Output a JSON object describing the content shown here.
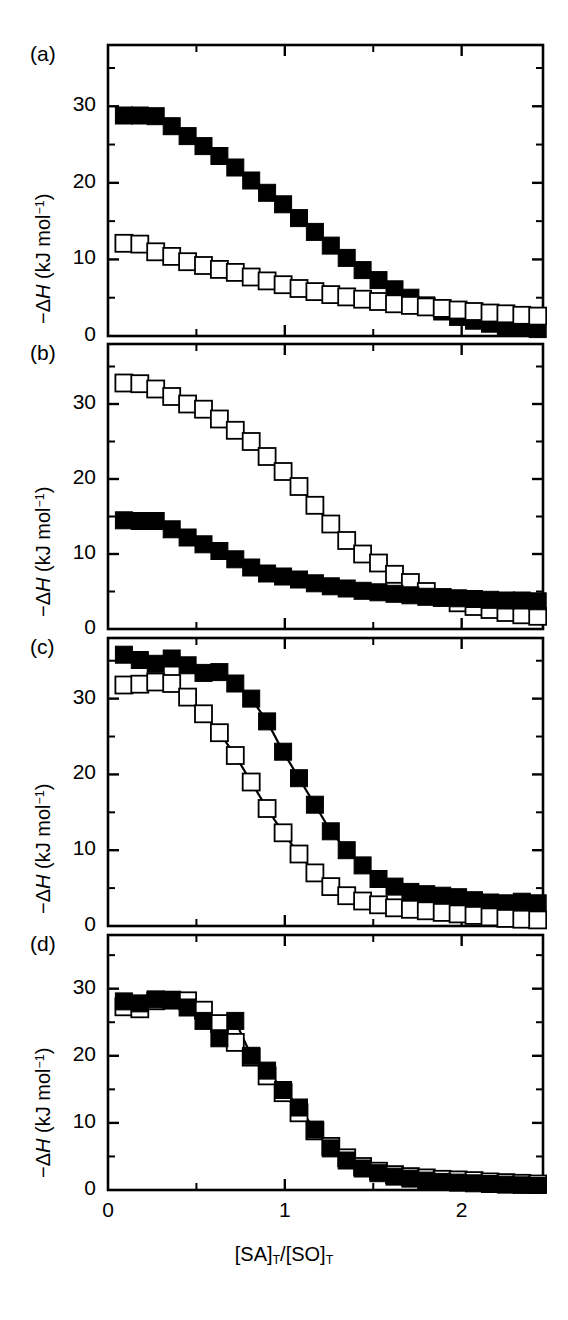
{
  "figure": {
    "width": 568,
    "height": 1320,
    "background": "#ffffff",
    "ink": "#000000",
    "xaxis_title_parts": {
      "lead": "[SA]",
      "sub1": "T",
      "slash": "/[SO]",
      "sub2": "T"
    },
    "yaxis_title_parts": {
      "minus": "−Δ",
      "italic": "H",
      "rest": " (kJ mol",
      "sup": "−1",
      "close": ")"
    },
    "panel_labels": [
      "(a)",
      "(b)",
      "(c)",
      "(d)"
    ]
  },
  "chart_data": [
    {
      "type": "scatter",
      "panel": "(a)",
      "title": "",
      "xlabel": "[SA]T/[SO]T",
      "ylabel": "−ΔH (kJ mol−1)",
      "xlim": [
        0,
        2.46
      ],
      "ylim": [
        0,
        38
      ],
      "xticks": [
        0,
        1,
        2
      ],
      "xticklabels": [
        "0",
        "1",
        "2"
      ],
      "xminorticks": [
        0.5,
        1.5
      ],
      "yticks": [
        0,
        10,
        20,
        30
      ],
      "yticklabels": [
        "0",
        "10",
        "20",
        "30"
      ],
      "yminorticks": [
        5,
        15,
        25,
        35
      ],
      "grid": false,
      "legend": "none",
      "series": [
        {
          "name": "filled-squares",
          "marker": "filled-square",
          "color": "#000000",
          "x": [
            0.09,
            0.18,
            0.27,
            0.36,
            0.45,
            0.54,
            0.63,
            0.72,
            0.81,
            0.9,
            0.99,
            1.08,
            1.17,
            1.26,
            1.35,
            1.44,
            1.53,
            1.62,
            1.71,
            1.8,
            1.89,
            1.98,
            2.07,
            2.16,
            2.25,
            2.34,
            2.43
          ],
          "values": [
            28.8,
            28.8,
            28.7,
            27.4,
            26.1,
            24.8,
            23.5,
            22.0,
            20.3,
            18.7,
            17.2,
            15.4,
            13.6,
            11.8,
            10.2,
            8.6,
            7.3,
            6.1,
            5.0,
            4.0,
            3.2,
            2.5,
            2.0,
            1.6,
            1.3,
            1.1,
            0.9
          ]
        },
        {
          "name": "open-squares",
          "marker": "open-square",
          "color": "#000000",
          "x": [
            0.09,
            0.18,
            0.27,
            0.36,
            0.45,
            0.54,
            0.63,
            0.72,
            0.81,
            0.9,
            0.99,
            1.08,
            1.17,
            1.26,
            1.35,
            1.44,
            1.53,
            1.62,
            1.71,
            1.8,
            1.89,
            1.98,
            2.07,
            2.16,
            2.25,
            2.34,
            2.43
          ],
          "values": [
            12.1,
            12.0,
            11.0,
            10.4,
            9.7,
            9.2,
            8.7,
            8.3,
            7.7,
            7.2,
            6.7,
            6.2,
            5.8,
            5.4,
            5.1,
            4.8,
            4.5,
            4.2,
            4.0,
            3.8,
            3.6,
            3.4,
            3.2,
            3.0,
            2.9,
            2.7,
            2.6
          ]
        }
      ]
    },
    {
      "type": "scatter",
      "panel": "(b)",
      "title": "",
      "xlabel": "[SA]T/[SO]T",
      "ylabel": "−ΔH (kJ mol−1)",
      "xlim": [
        0,
        2.46
      ],
      "ylim": [
        0,
        38
      ],
      "xticks": [
        0,
        1,
        2
      ],
      "xticklabels": [
        "0",
        "1",
        "2"
      ],
      "xminorticks": [
        0.5,
        1.5
      ],
      "yticks": [
        0,
        10,
        20,
        30
      ],
      "yticklabels": [
        "0",
        "10",
        "20",
        "30"
      ],
      "yminorticks": [
        5,
        15,
        25,
        35
      ],
      "grid": false,
      "legend": "none",
      "series": [
        {
          "name": "open-squares",
          "marker": "open-square",
          "color": "#000000",
          "x": [
            0.09,
            0.18,
            0.27,
            0.36,
            0.45,
            0.54,
            0.63,
            0.72,
            0.81,
            0.9,
            0.99,
            1.08,
            1.17,
            1.26,
            1.35,
            1.44,
            1.53,
            1.62,
            1.71,
            1.8,
            1.89,
            1.98,
            2.07,
            2.16,
            2.25,
            2.34,
            2.43
          ],
          "values": [
            32.8,
            32.7,
            32.0,
            31.0,
            30.0,
            29.3,
            28.0,
            26.5,
            25.0,
            23.0,
            21.0,
            19.0,
            16.5,
            14.0,
            11.8,
            10.0,
            8.8,
            7.3,
            6.2,
            5.0,
            4.2,
            3.5,
            3.0,
            2.6,
            2.2,
            1.9,
            1.7
          ]
        },
        {
          "name": "filled-squares",
          "marker": "filled-square",
          "color": "#000000",
          "x": [
            0.09,
            0.18,
            0.27,
            0.36,
            0.45,
            0.54,
            0.63,
            0.72,
            0.81,
            0.9,
            0.99,
            1.08,
            1.17,
            1.26,
            1.35,
            1.44,
            1.53,
            1.62,
            1.71,
            1.8,
            1.89,
            1.98,
            2.07,
            2.16,
            2.25,
            2.34,
            2.43
          ],
          "values": [
            14.5,
            14.4,
            14.4,
            13.3,
            12.2,
            11.3,
            10.4,
            9.3,
            8.2,
            7.4,
            7.0,
            6.6,
            6.1,
            5.7,
            5.4,
            5.1,
            4.9,
            4.7,
            4.5,
            4.3,
            4.2,
            4.1,
            4.0,
            3.9,
            3.8,
            3.8,
            3.7
          ]
        }
      ]
    },
    {
      "type": "scatter",
      "panel": "(c)",
      "title": "",
      "xlabel": "[SA]T/[SO]T",
      "ylabel": "−ΔH (kJ mol−1)",
      "xlim": [
        0,
        2.46
      ],
      "ylim": [
        0,
        38
      ],
      "xticks": [
        0,
        1,
        2
      ],
      "xticklabels": [
        "0",
        "1",
        "2"
      ],
      "xminorticks": [
        0.5,
        1.5
      ],
      "yticks": [
        0,
        10,
        20,
        30
      ],
      "yticklabels": [
        "0",
        "10",
        "20",
        "30"
      ],
      "yminorticks": [
        5,
        15,
        25,
        35
      ],
      "grid": false,
      "legend": "none",
      "series": [
        {
          "name": "filled-squares",
          "marker": "filled-square",
          "color": "#000000",
          "x": [
            0.09,
            0.18,
            0.27,
            0.36,
            0.45,
            0.54,
            0.63,
            0.72,
            0.81,
            0.9,
            0.99,
            1.08,
            1.17,
            1.26,
            1.35,
            1.44,
            1.53,
            1.62,
            1.71,
            1.8,
            1.89,
            1.98,
            2.07,
            2.16,
            2.25,
            2.34,
            2.43
          ],
          "values": [
            35.8,
            35.1,
            34.6,
            35.3,
            34.4,
            33.4,
            33.5,
            32.0,
            30.0,
            27.0,
            23.0,
            19.5,
            16.0,
            12.5,
            10.0,
            8.0,
            6.2,
            5.2,
            4.5,
            4.2,
            4.0,
            3.8,
            3.4,
            3.1,
            3.0,
            3.2,
            3.0
          ]
        },
        {
          "name": "open-squares",
          "marker": "open-square",
          "color": "#000000",
          "x": [
            0.09,
            0.18,
            0.27,
            0.36,
            0.45,
            0.54,
            0.63,
            0.72,
            0.81,
            0.9,
            0.99,
            1.08,
            1.17,
            1.26,
            1.35,
            1.44,
            1.53,
            1.62,
            1.71,
            1.8,
            1.89,
            1.98,
            2.07,
            2.16,
            2.25,
            2.34,
            2.43
          ],
          "values": [
            31.8,
            31.9,
            32.2,
            32.0,
            30.2,
            28.0,
            25.5,
            22.5,
            19.0,
            15.5,
            12.3,
            9.5,
            7.0,
            5.2,
            4.0,
            3.3,
            2.8,
            2.4,
            2.2,
            2.0,
            1.8,
            1.6,
            1.4,
            1.2,
            1.0,
            0.9,
            0.8
          ]
        }
      ]
    },
    {
      "type": "scatter",
      "panel": "(d)",
      "title": "",
      "xlabel": "[SA]T/[SO]T",
      "ylabel": "−ΔH (kJ mol−1)",
      "xlim": [
        0,
        2.46
      ],
      "ylim": [
        0,
        38
      ],
      "xticks": [
        0,
        1,
        2
      ],
      "xticklabels": [
        "0",
        "1",
        "2"
      ],
      "xminorticks": [
        0.5,
        1.5
      ],
      "yticks": [
        0,
        10,
        20,
        30
      ],
      "yticklabels": [
        "0",
        "10",
        "20",
        "30"
      ],
      "yminorticks": [
        5,
        15,
        25,
        35
      ],
      "grid": false,
      "legend": "none",
      "series": [
        {
          "name": "open-squares",
          "marker": "open-square",
          "color": "#000000",
          "x": [
            0.09,
            0.18,
            0.27,
            0.36,
            0.45,
            0.54,
            0.63,
            0.72,
            0.81,
            0.9,
            0.99,
            1.08,
            1.17,
            1.26,
            1.35,
            1.44,
            1.53,
            1.62,
            1.71,
            1.8,
            1.89,
            1.98,
            2.07,
            2.16,
            2.25,
            2.34,
            2.43
          ],
          "values": [
            27.3,
            27.0,
            28.2,
            28.3,
            28.2,
            26.8,
            24.8,
            22.0,
            19.8,
            17.0,
            14.5,
            11.5,
            8.8,
            6.5,
            4.8,
            3.5,
            2.8,
            2.3,
            2.0,
            1.8,
            1.6,
            1.5,
            1.4,
            1.2,
            1.1,
            1.0,
            0.9
          ]
        },
        {
          "name": "filled-squares",
          "marker": "filled-square",
          "color": "#000000",
          "x": [
            0.09,
            0.18,
            0.27,
            0.36,
            0.45,
            0.54,
            0.63,
            0.72,
            0.81,
            0.9,
            0.99,
            1.08,
            1.17,
            1.26,
            1.35,
            1.44,
            1.53,
            1.62,
            1.71,
            1.8,
            1.89,
            1.98,
            2.07,
            2.16,
            2.25,
            2.34,
            2.43
          ],
          "values": [
            28.1,
            27.8,
            28.4,
            28.3,
            27.2,
            25.2,
            22.6,
            25.2,
            20.0,
            17.8,
            14.9,
            12.3,
            9.0,
            6.2,
            4.4,
            3.2,
            2.5,
            2.0,
            1.7,
            1.4,
            1.2,
            1.1,
            1.0,
            0.9,
            0.8,
            0.7,
            0.6
          ]
        }
      ]
    }
  ]
}
